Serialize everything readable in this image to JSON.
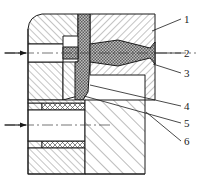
{
  "figure": {
    "type": "engineering-section-drawing",
    "title": "",
    "background_color": "#ffffff",
    "line_color": "#1a1a1a",
    "hatch_color": "#4a4a4a",
    "sprue_fill_color": "#8c8c8c",
    "width": 200,
    "height": 188
  },
  "callouts": [
    {
      "id": "1",
      "label": "1",
      "x": 184,
      "y": 14,
      "leader_from": [
        181,
        19
      ],
      "leader_to": [
        152,
        31
      ]
    },
    {
      "id": "2",
      "label": "2",
      "x": 184,
      "y": 48,
      "leader_from": [
        181,
        53
      ],
      "leader_to": [
        154,
        53
      ]
    },
    {
      "id": "3",
      "label": "3",
      "x": 184,
      "y": 68,
      "leader_from": [
        181,
        73
      ],
      "leader_to": [
        153,
        64
      ]
    },
    {
      "id": "4",
      "label": "4",
      "x": 184,
      "y": 101,
      "leader_from": [
        181,
        106
      ],
      "leader_to": [
        90,
        85
      ]
    },
    {
      "id": "5",
      "label": "5",
      "x": 184,
      "y": 118,
      "leader_from": [
        181,
        123
      ],
      "leader_to": [
        84,
        96
      ]
    },
    {
      "id": "6",
      "label": "6",
      "x": 184,
      "y": 136,
      "leader_from": [
        181,
        141
      ],
      "leader_to": [
        146,
        112
      ]
    }
  ],
  "flow_arrows": [
    {
      "name": "upper-inlet-arrow",
      "x": 10,
      "y": 53,
      "direction": "right"
    },
    {
      "name": "lower-inlet-arrow",
      "x": 10,
      "y": 125,
      "direction": "right"
    }
  ],
  "center_lines": [
    {
      "name": "upper-center-line",
      "y": 53,
      "x1": 4,
      "x2": 196
    },
    {
      "name": "lower-center-line",
      "y": 125,
      "x1": 4,
      "x2": 110
    }
  ],
  "parts": {
    "upper_left_block": "upper left die half (section hatched)",
    "upper_right_block": "upper right die half (section hatched)",
    "sprue": "tapered sprue / runner (stippled molten metal)",
    "vertical_runner": "vertical runner channel",
    "lower_left_block": "lower left die block",
    "lower_right_block": "lower right die block",
    "upper_seal_band": "upper cross-hatched seal / insert band",
    "lower_seal_band": "lower cross-hatched seal / insert band"
  }
}
